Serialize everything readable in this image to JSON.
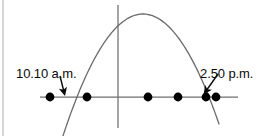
{
  "figure": {
    "background_color": "#ffffff",
    "border": {
      "name": "left-border-rule",
      "color": "#b9b9b9",
      "x": 3,
      "y1": 0,
      "y2": 136
    }
  },
  "labels": {
    "left": {
      "text": "10.10 a.m.",
      "x": 16,
      "y": 78,
      "color": "#0a0a0a"
    },
    "right": {
      "text": "2.50 p.m.",
      "x": 200,
      "y": 78,
      "color": "#0a0a0a"
    }
  },
  "chart_data": {
    "type": "line",
    "title": "",
    "xlabel": "",
    "ylabel": "",
    "grid": false,
    "legend": null,
    "annotations": [
      {
        "text": "10.10 a.m.",
        "points_to": "left x-intercept",
        "arrow": true
      },
      {
        "text": "2.50 p.m.",
        "points_to": "right x-intercept",
        "arrow": true
      }
    ],
    "axes": {
      "horizontal": {
        "name": "x-axis",
        "y": 97,
        "x_start": 40,
        "x_end": 238,
        "color": "#6f6f6f"
      },
      "vertical": {
        "name": "y-axis",
        "x": 118,
        "y_start": 5,
        "y_end": 128,
        "color": "#6f6f6f"
      }
    },
    "curve": {
      "name": "parabola",
      "shape": "downward-opening parabola",
      "color": "#6a6a6a",
      "vertex": {
        "x": 143,
        "y": 14
      },
      "x_intercepts": [
        63,
        206
      ],
      "x_start": 50,
      "x_end": 219,
      "y_at_x_start": 124,
      "y_at_x_end": 124
    },
    "points": {
      "name": "axis-dots",
      "color": "#000000",
      "radius": 4.4,
      "y": 97,
      "x_values": [
        50,
        87,
        148,
        178,
        206,
        216
      ]
    },
    "arrows": [
      {
        "name": "left-callout-arrow",
        "from": {
          "x": 60,
          "y": 76
        },
        "to": {
          "x": 64,
          "y": 92
        },
        "color": "#0a0a0a"
      },
      {
        "name": "right-callout-arrow",
        "from": {
          "x": 218,
          "y": 74
        },
        "to": {
          "x": 206,
          "y": 91
        },
        "color": "#0a0a0a"
      }
    ]
  }
}
